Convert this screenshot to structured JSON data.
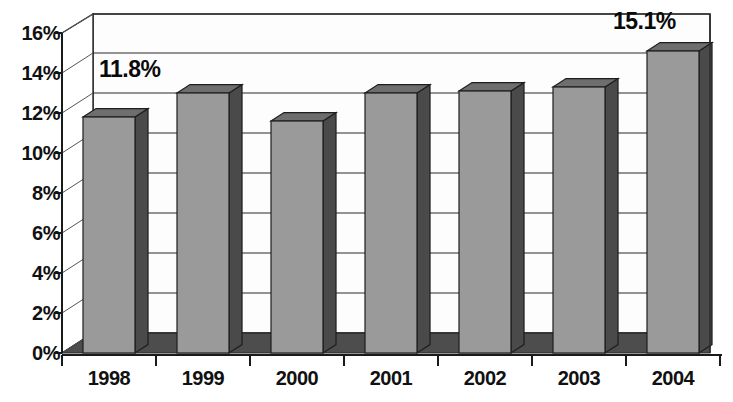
{
  "chart_data": {
    "type": "bar",
    "title": "",
    "subtitle": "",
    "xlabel": "",
    "ylabel": "",
    "categories": [
      "1998",
      "1999",
      "2000",
      "2001",
      "2002",
      "2003",
      "2004"
    ],
    "values": [
      11.8,
      13.0,
      11.6,
      13.0,
      13.1,
      13.3,
      15.1
    ],
    "series": [
      {
        "name": "",
        "values": [
          11.8,
          13.0,
          11.6,
          13.0,
          13.1,
          13.3,
          15.1
        ]
      }
    ],
    "ylim": [
      0,
      16
    ],
    "ytick_step": 2,
    "ytick_labels": [
      "0%",
      "2%",
      "4%",
      "6%",
      "8%",
      "10%",
      "12%",
      "14%",
      "16%"
    ],
    "ytick_values": [
      0,
      2,
      4,
      6,
      8,
      10,
      12,
      14,
      16
    ],
    "xtick_labels": [
      "1998",
      "1999",
      "2000",
      "2001",
      "2002",
      "2003",
      "2004"
    ],
    "grid": true,
    "grid_axis": "y",
    "legend": false,
    "legend_position": "none",
    "value_format": "percent",
    "three_d": true,
    "data_labels": [
      {
        "category": "1998",
        "text": "11.8%",
        "value": 11.8
      },
      {
        "category": "2004",
        "text": "15.1%",
        "value": 15.1
      }
    ],
    "colors": {
      "bar_front": "#9a9a9a",
      "bar_side": "#4a4a4a",
      "bar_top": "#6e6e6e",
      "floor": "#4d4d4d",
      "wall": "#fdfdfd",
      "grid_line": "#2b2b2b",
      "axis_line": "#1a1a1a",
      "text": "#111111",
      "background": "#ffffff"
    }
  }
}
